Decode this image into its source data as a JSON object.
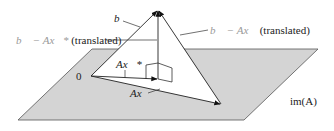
{
  "figure": {
    "plane_label": "im(A)",
    "origin_label": "0",
    "vectors": {
      "b": {
        "label": "b⃗",
        "from": [
          91,
          76
        ],
        "to": [
          158,
          10
        ]
      },
      "Ax_star": {
        "label": "Ax⃗*",
        "from": [
          91,
          76
        ],
        "to": [
          158,
          79
        ]
      },
      "Ax": {
        "label": "Ax⃗",
        "from": [
          91,
          76
        ],
        "to": [
          221,
          104
        ]
      },
      "b_minus_Ax_star": {
        "label_math": "b⃗ − Ax⃗*",
        "label_note": "(translated)",
        "from": [
          158,
          79
        ],
        "to": [
          158,
          10
        ]
      },
      "b_minus_Ax": {
        "label_math": "b⃗ − Ax⃗",
        "label_note": "(translated)",
        "from": [
          221,
          104
        ],
        "to": [
          158,
          10
        ]
      }
    },
    "plane_polygon": [
      [
        92,
        49
      ],
      [
        318,
        49
      ],
      [
        244,
        120
      ],
      [
        18,
        120
      ]
    ],
    "colors": {
      "plane_fill": "#d4d4d4",
      "line": "#333333",
      "ghost_label": "#9a9a9a",
      "background": "#ffffff"
    }
  }
}
